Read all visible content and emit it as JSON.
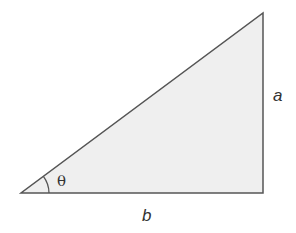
{
  "diagram": {
    "type": "right-triangle",
    "vertices": {
      "left": [
        21,
        193
      ],
      "right_angle": [
        263,
        193
      ],
      "top": [
        263,
        13
      ]
    },
    "fill_color": "#efefef",
    "stroke_color": "#555555",
    "labels": {
      "opposite_side": "a",
      "adjacent_side": "b",
      "angle": "θ"
    }
  }
}
